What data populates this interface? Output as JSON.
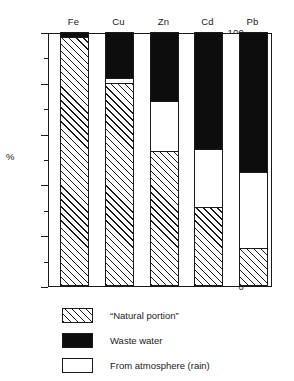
{
  "chart_data": {
    "type": "bar",
    "title": "",
    "subtitle": "",
    "xlabel": "",
    "ylabel": "%",
    "ylim": [
      0,
      100
    ],
    "grid": false,
    "stacked": true,
    "legend_position": "bottom-left",
    "categories": [
      "Fe",
      "Cu",
      "Zn",
      "Cd",
      "Pb"
    ],
    "series": [
      {
        "name": "“Natural portion”",
        "pattern": "diagonal-hatch",
        "values": [
          98,
          80,
          53,
          31,
          15
        ]
      },
      {
        "name": "From atmosphere (rain)",
        "pattern": "stipple-dots",
        "values": [
          0,
          2,
          20,
          23,
          30
        ]
      },
      {
        "name": "Waste water",
        "pattern": "solid-black",
        "values": [
          2,
          18,
          27,
          46,
          55
        ]
      }
    ],
    "stack_boundaries": {
      "Fe": {
        "natural_top": 98,
        "atmosphere_top": 98,
        "waste_top": 100
      },
      "Cu": {
        "natural_top": 80,
        "atmosphere_top": 82,
        "waste_top": 100
      },
      "Zn": {
        "natural_top": 53,
        "atmosphere_top": 73,
        "waste_top": 100
      },
      "Cd": {
        "natural_top": 31,
        "atmosphere_top": 54,
        "waste_top": 100
      },
      "Pb": {
        "natural_top": 15,
        "atmosphere_top": 45,
        "waste_top": 100
      }
    },
    "y_ticks_major": [
      0,
      20,
      40,
      60,
      80,
      100
    ],
    "y_ticks_major_labels": [
      "0",
      "20",
      "40",
      "60",
      "80",
      "100"
    ],
    "y_ticks_minor": [
      10,
      30,
      50,
      70,
      90
    ]
  },
  "legend": {
    "items": [
      {
        "label": "“Natural portion”",
        "pattern": "diagonal-hatch"
      },
      {
        "label": "Waste water",
        "pattern": "solid-black"
      },
      {
        "label": "From atmosphere (rain)",
        "pattern": "stipple-dots"
      }
    ]
  },
  "colors": {
    "ink": "#1a1a1a",
    "black_fill": "#0d0d0d",
    "paper": "#ffffff"
  }
}
